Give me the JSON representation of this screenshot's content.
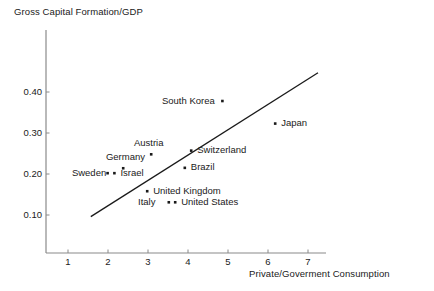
{
  "chart_data": {
    "type": "scatter",
    "title": "",
    "subtitle": "",
    "xlabel": "Private/Goverment Consumption",
    "ylabel": "Gross Capital Formation/GDP",
    "xlim": [
      0.35,
      7.4
    ],
    "ylim": [
      0.045,
      0.465
    ],
    "xticks": [
      "1",
      "2",
      "3",
      "4",
      "5",
      "6",
      "7"
    ],
    "xtick_values": [
      1,
      2,
      3,
      4,
      5,
      6,
      7
    ],
    "yticks": [
      "0.10",
      "0.20",
      "0.30",
      "0.40"
    ],
    "ytick_values": [
      0.1,
      0.2,
      0.3,
      0.4
    ],
    "grid": false,
    "legend": "none",
    "marker": "square-dot",
    "marker_color": "#1a1a1a",
    "line_color": "#1a1a1a",
    "axis_color": "#8a8a8a",
    "points": [
      {
        "label": "South Korea",
        "x": 4.86,
        "y": 0.378,
        "label_side": "left"
      },
      {
        "label": "Japan",
        "x": 6.18,
        "y": 0.323,
        "label_side": "right"
      },
      {
        "label": "Switzerland",
        "x": 4.08,
        "y": 0.257,
        "label_side": "right"
      },
      {
        "label": "Austria",
        "x": 3.08,
        "y": 0.248,
        "label_side": "above"
      },
      {
        "label": "Germany",
        "x": 2.38,
        "y": 0.214,
        "label_side": "above"
      },
      {
        "label": "Brazil",
        "x": 3.92,
        "y": 0.215,
        "label_side": "right"
      },
      {
        "label": "Sweden",
        "x": 1.99,
        "y": 0.202,
        "label_side": "left"
      },
      {
        "label": "Israel",
        "x": 2.16,
        "y": 0.202,
        "label_side": "right"
      },
      {
        "label": "United Kingdom",
        "x": 2.98,
        "y": 0.158,
        "label_side": "right"
      },
      {
        "label": "Italy",
        "x": 3.52,
        "y": 0.131,
        "label_side": "left"
      },
      {
        "label": "United States",
        "x": 3.68,
        "y": 0.131,
        "label_side": "right"
      }
    ],
    "trend_line": {
      "type": "line",
      "x0": 1.57,
      "y0": 0.096,
      "x1": 7.25,
      "y1": 0.447
    }
  }
}
